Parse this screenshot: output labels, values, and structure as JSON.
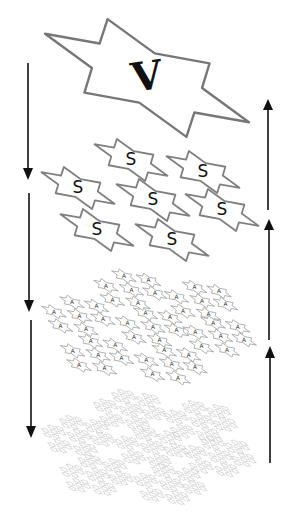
{
  "diagram": {
    "levels": [
      {
        "name": "level-1",
        "letter": "V",
        "count": 1,
        "stroke": "#777777",
        "letter_color": "#111111"
      },
      {
        "name": "level-2",
        "letter": "S",
        "count": 7,
        "stroke": "#808080",
        "letter_color": "#111111"
      },
      {
        "name": "level-3",
        "letter": "A",
        "count": 49,
        "stroke": "#a0a0a0",
        "letter_color": "#333333"
      },
      {
        "name": "level-4",
        "letter": "",
        "count": 343,
        "stroke": "#b8b8b8",
        "letter_color": "#888888"
      }
    ],
    "arrows": {
      "left": {
        "direction": "down",
        "count": 3
      },
      "right": {
        "direction": "up",
        "count": 3
      }
    }
  }
}
